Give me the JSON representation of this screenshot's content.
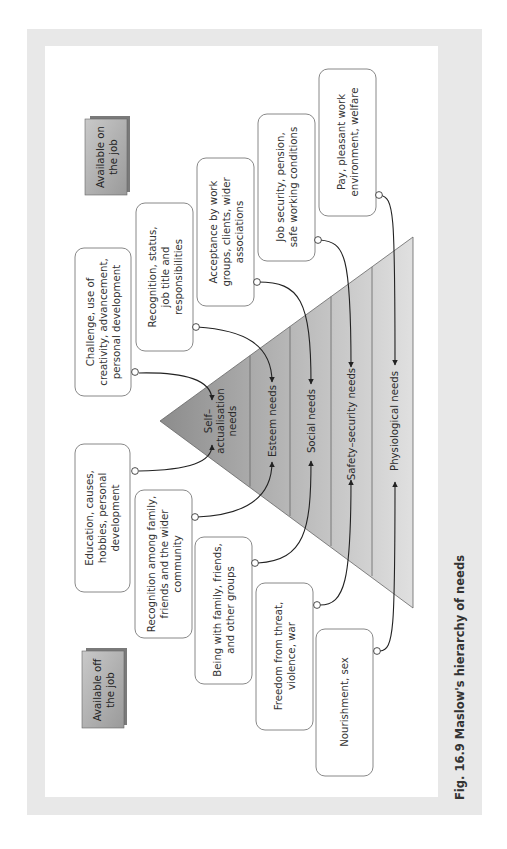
{
  "figure": {
    "caption": "Fig. 16.9  Maslow's hierarchy of needs",
    "orientation": "rotated 90° counter-clockwise",
    "colors": {
      "frame": "#e8e8e8",
      "panel": "#ffffff",
      "box_border": "#6a6a6a",
      "pyramid_dark": "#8f8f8f",
      "pyramid_light": "#dcdcdc",
      "connector": "#222222",
      "label_box_fill": "#b4b4b4",
      "label_box_shadow": "#7a7a7a"
    }
  },
  "headers": {
    "on_job": {
      "line1": "Available on",
      "line2": "the job"
    },
    "off_job": {
      "line1": "Available off",
      "line2": "the job"
    }
  },
  "pyramid": {
    "levels": [
      {
        "id": "self-actualisation",
        "line1": "Self–",
        "line2": "actualisation",
        "line3": "needs"
      },
      {
        "id": "esteem",
        "line1": "Esteem needs"
      },
      {
        "id": "social",
        "line1": "Social needs"
      },
      {
        "id": "safety",
        "line1": "Safety–security needs"
      },
      {
        "id": "physiological",
        "line1": "Physiological needs"
      }
    ]
  },
  "on_job_boxes": [
    {
      "level": "self-actualisation",
      "lines": [
        "Challenge, use of",
        "creativity, advancement,",
        "personal development"
      ]
    },
    {
      "level": "esteem",
      "lines": [
        "Recognition, status,",
        "job title and",
        "responsibilities"
      ]
    },
    {
      "level": "social",
      "lines": [
        "Acceptance by work",
        "groups, clients, wider",
        "associations"
      ]
    },
    {
      "level": "safety",
      "lines": [
        "Job security, pension,",
        "safe working conditions"
      ]
    },
    {
      "level": "physiological",
      "lines": [
        "Pay, pleasant work",
        "environment, welfare"
      ]
    }
  ],
  "off_job_boxes": [
    {
      "level": "self-actualisation",
      "lines": [
        "Education, causes,",
        "hobbies, personal",
        "development"
      ]
    },
    {
      "level": "esteem",
      "lines": [
        "Recognition among family,",
        "friends and the wider",
        "community"
      ]
    },
    {
      "level": "social",
      "lines": [
        "Being with family, friends,",
        "and other groups"
      ]
    },
    {
      "level": "safety",
      "lines": [
        "Freedom from threat,",
        "violence, war"
      ]
    },
    {
      "level": "physiological",
      "lines": [
        "Nourishment, sex"
      ]
    }
  ]
}
